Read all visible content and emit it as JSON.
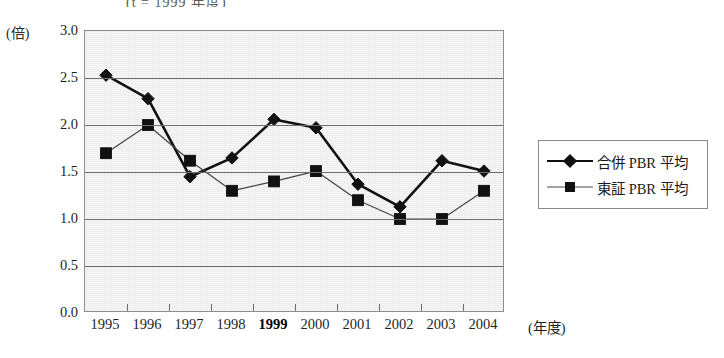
{
  "title": {
    "clipped_text": "(t = 1999 年度)"
  },
  "axes": {
    "y_unit_label": "(倍)",
    "x_unit_label": "(年度)",
    "y_ticks": [
      "3.0",
      "2.5",
      "2.0",
      "1.5",
      "1.0",
      "0.5",
      "0.0"
    ],
    "x_ticks": [
      "1995",
      "1996",
      "1997",
      "1998",
      "1999",
      "2000",
      "2001",
      "2002",
      "2003",
      "2004"
    ],
    "x_tick_bold": "1999"
  },
  "legend": {
    "items": [
      {
        "label": "合併 PBR 平均",
        "marker": "diamond-marker"
      },
      {
        "label": "東証 PBR 平均",
        "marker": "square-marker"
      }
    ]
  },
  "chart_data": {
    "type": "line",
    "title": "(t = 1999 年度)",
    "xlabel": "(年度)",
    "ylabel": "(倍)",
    "ylim": [
      0.0,
      3.0
    ],
    "ytick_step": 0.5,
    "grid": "horizontal",
    "legend_position": "right",
    "categories": [
      "1995",
      "1996",
      "1997",
      "1998",
      "1999",
      "2000",
      "2001",
      "2002",
      "2003",
      "2004"
    ],
    "series": [
      {
        "name": "合併 PBR 平均",
        "marker": "diamond",
        "values": [
          2.53,
          2.28,
          1.45,
          1.65,
          2.06,
          1.97,
          1.37,
          1.13,
          1.62,
          1.51
        ]
      },
      {
        "name": "東証 PBR 平均",
        "marker": "square",
        "values": [
          1.7,
          2.0,
          1.62,
          1.3,
          1.4,
          1.51,
          1.2,
          1.0,
          1.0,
          1.3
        ]
      }
    ]
  },
  "colors": {
    "plot_background": "#ededed",
    "grid": "#6f6f6f",
    "series_primary": "#111111",
    "series_secondary": "#444444",
    "text": "#1a1a1a"
  }
}
